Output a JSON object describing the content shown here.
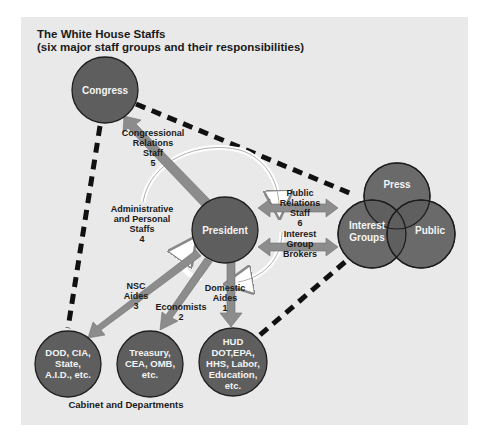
{
  "title": {
    "line1": "The White House Staffs",
    "line2": "(six major staff groups and their responsibilities)"
  },
  "nodes": {
    "congress": {
      "label": "Congress"
    },
    "president": {
      "label": "President"
    },
    "press": {
      "label": "Press"
    },
    "interest_groups": {
      "lines": [
        "Interest",
        "Groups"
      ]
    },
    "public": {
      "label": "Public"
    },
    "dod": {
      "lines": [
        "DOD, CIA,",
        "State,",
        "A.I.D., etc."
      ]
    },
    "treasury": {
      "lines": [
        "Treasury,",
        "CEA, OMB,",
        "etc."
      ]
    },
    "hud": {
      "lines": [
        "HUD",
        "DOT,EPA,",
        "HHS, Labor,",
        "Education,",
        "etc."
      ]
    }
  },
  "staff_groups": {
    "congressional": {
      "lines": [
        "Congressional",
        "Relations",
        "Staff",
        "5"
      ]
    },
    "administrative": {
      "lines": [
        "Administrative",
        "and Personal",
        "Staffs",
        "4"
      ]
    },
    "public_relations": {
      "lines": [
        "Public",
        "Relations",
        "Staff",
        "6"
      ]
    },
    "interest_brokers": {
      "lines": [
        "Interest",
        "Group",
        "Brokers"
      ]
    },
    "nsc": {
      "lines": [
        "NSC",
        "Aides",
        "3"
      ]
    },
    "economists": {
      "lines": [
        "Economists",
        "2"
      ]
    },
    "domestic": {
      "lines": [
        "Domestic",
        "Aides",
        "1"
      ]
    }
  },
  "footer": "Cabinet and Departments",
  "colors": {
    "panel_bg": "#e9e9e9",
    "circle_fill": "#5e5e5e",
    "circle_stroke": "#1e1e1e",
    "arrow_fill": "#8c8c8c",
    "dash_line": "#111111",
    "cycle_arrow": "#ffffff"
  }
}
